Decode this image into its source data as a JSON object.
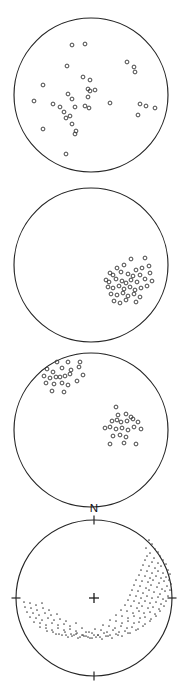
{
  "figure": {
    "background_color": "#ffffff",
    "outline_color": "#252525",
    "symbol_open_color": "#3a3a3a",
    "symbol_dot_color": "#4a4a4a",
    "width_px": 181,
    "height_px": 693,
    "north_label": "N"
  },
  "chart_data": [
    {
      "type": "scatter",
      "panel_index": 1,
      "projection": "equal-area lower hemisphere stereonet",
      "title": "",
      "xlabel": "",
      "ylabel": "",
      "symbol": "open-circle",
      "grid": false,
      "legend": null,
      "center_px": [
        91,
        95
      ],
      "radius_px": 77,
      "n_points": 40,
      "points_px": [
        [
          72,
          45
        ],
        [
          85,
          44
        ],
        [
          67,
          66
        ],
        [
          127,
          62
        ],
        [
          134,
          67
        ],
        [
          135,
          72
        ],
        [
          83,
          77
        ],
        [
          90,
          80
        ],
        [
          43,
          85
        ],
        [
          34,
          101
        ],
        [
          53,
          104
        ],
        [
          88,
          89
        ],
        [
          90,
          91
        ],
        [
          95,
          90
        ],
        [
          68,
          94
        ],
        [
          72,
          99
        ],
        [
          88,
          97
        ],
        [
          75,
          107
        ],
        [
          85,
          106
        ],
        [
          89,
          108
        ],
        [
          110,
          103
        ],
        [
          60,
          107
        ],
        [
          64,
          112
        ],
        [
          66,
          118
        ],
        [
          140,
          104
        ],
        [
          146,
          106
        ],
        [
          155,
          108
        ],
        [
          70,
          116
        ],
        [
          138,
          115
        ],
        [
          72,
          124
        ],
        [
          76,
          131
        ],
        [
          43,
          129
        ],
        [
          75,
          134
        ],
        [
          66,
          154
        ]
      ]
    },
    {
      "type": "scatter",
      "panel_index": 2,
      "projection": "equal-area lower hemisphere stereonet",
      "title": "",
      "xlabel": "",
      "ylabel": "",
      "symbol": "open-circle",
      "grid": false,
      "legend": null,
      "center_px": [
        91,
        265
      ],
      "radius_px": 77,
      "n_points": 41,
      "cluster_center_px": [
        128,
        281
      ],
      "points_px": [
        [
          131,
          259
        ],
        [
          145,
          258
        ],
        [
          117,
          268
        ],
        [
          124,
          265
        ],
        [
          136,
          270
        ],
        [
          142,
          268
        ],
        [
          149,
          266
        ],
        [
          110,
          273
        ],
        [
          113,
          275
        ],
        [
          121,
          272
        ],
        [
          128,
          274
        ],
        [
          133,
          276
        ],
        [
          140,
          275
        ],
        [
          150,
          273
        ],
        [
          106,
          280
        ],
        [
          109,
          282
        ],
        [
          116,
          279
        ],
        [
          122,
          281
        ],
        [
          126,
          283
        ],
        [
          131,
          280
        ],
        [
          137,
          282
        ],
        [
          145,
          279
        ],
        [
          152,
          281
        ],
        [
          108,
          287
        ],
        [
          113,
          288
        ],
        [
          119,
          286
        ],
        [
          124,
          289
        ],
        [
          130,
          287
        ],
        [
          135,
          290
        ],
        [
          141,
          288
        ],
        [
          147,
          286
        ],
        [
          111,
          294
        ],
        [
          117,
          295
        ],
        [
          123,
          293
        ],
        [
          128,
          296
        ],
        [
          134,
          294
        ],
        [
          140,
          297
        ],
        [
          114,
          301
        ],
        [
          120,
          303
        ],
        [
          126,
          300
        ],
        [
          136,
          302
        ]
      ]
    },
    {
      "type": "scatter",
      "panel_index": 3,
      "projection": "equal-area lower hemisphere stereonet",
      "title": "",
      "xlabel": "",
      "ylabel": "",
      "symbol": "open-circle",
      "grid": false,
      "legend": null,
      "center_px": [
        91,
        430
      ],
      "radius_px": 77,
      "n_points": 40,
      "cluster_a_center_px": [
        62,
        378
      ],
      "cluster_b_center_px": [
        121,
        424
      ],
      "points_px": [
        [
          57,
          362
        ],
        [
          68,
          362
        ],
        [
          80,
          362
        ],
        [
          47,
          369
        ],
        [
          53,
          372
        ],
        [
          62,
          368
        ],
        [
          71,
          370
        ],
        [
          79,
          367
        ],
        [
          44,
          376
        ],
        [
          50,
          378
        ],
        [
          56,
          377
        ],
        [
          60,
          377
        ],
        [
          65,
          376
        ],
        [
          70,
          374
        ],
        [
          83,
          375
        ],
        [
          46,
          383
        ],
        [
          54,
          384
        ],
        [
          62,
          383
        ],
        [
          68,
          385
        ],
        [
          77,
          381
        ],
        [
          52,
          391
        ],
        [
          64,
          392
        ],
        [
          116,
          407
        ],
        [
          118,
          415
        ],
        [
          126,
          414
        ],
        [
          131,
          417
        ],
        [
          112,
          421
        ],
        [
          117,
          420
        ],
        [
          121,
          422
        ],
        [
          127,
          421
        ],
        [
          133,
          419
        ],
        [
          138,
          422
        ],
        [
          105,
          428
        ],
        [
          110,
          427
        ],
        [
          116,
          429
        ],
        [
          122,
          428
        ],
        [
          128,
          430
        ],
        [
          134,
          427
        ],
        [
          141,
          429
        ],
        [
          113,
          436
        ],
        [
          120,
          435
        ],
        [
          126,
          437
        ],
        [
          110,
          444
        ],
        [
          124,
          443
        ],
        [
          136,
          444
        ]
      ]
    },
    {
      "type": "scatter",
      "panel_index": 4,
      "projection": "equal-area lower hemisphere stereonet",
      "title": "",
      "xlabel": "",
      "ylabel": "",
      "symbol": "small-filled-dot",
      "grid": false,
      "legend": null,
      "center_px": [
        94,
        598
      ],
      "radius_px": 78,
      "north_label": "N",
      "tick_azimuths_deg": [
        0,
        90,
        180,
        270
      ],
      "center_marker": "plus-cross",
      "n_points": 210,
      "pattern": "girdle arc sweeping from NE rim through SE and S to SW",
      "points_px": [
        [
          149,
          540
        ],
        [
          152,
          544
        ],
        [
          146,
          548
        ],
        [
          155,
          549
        ],
        [
          150,
          553
        ],
        [
          158,
          552
        ],
        [
          147,
          556
        ],
        [
          154,
          558
        ],
        [
          160,
          556
        ],
        [
          145,
          560
        ],
        [
          152,
          562
        ],
        [
          158,
          563
        ],
        [
          163,
          560
        ],
        [
          143,
          565
        ],
        [
          149,
          566
        ],
        [
          155,
          568
        ],
        [
          161,
          566
        ],
        [
          166,
          564
        ],
        [
          141,
          570
        ],
        [
          147,
          571
        ],
        [
          152,
          573
        ],
        [
          158,
          571
        ],
        [
          163,
          573
        ],
        [
          168,
          570
        ],
        [
          139,
          575
        ],
        [
          145,
          576
        ],
        [
          150,
          578
        ],
        [
          156,
          576
        ],
        [
          161,
          578
        ],
        [
          166,
          577
        ],
        [
          170,
          574
        ],
        [
          136,
          580
        ],
        [
          142,
          581
        ],
        [
          148,
          582
        ],
        [
          153,
          580
        ],
        [
          159,
          583
        ],
        [
          164,
          581
        ],
        [
          169,
          580
        ],
        [
          134,
          585
        ],
        [
          140,
          586
        ],
        [
          146,
          588
        ],
        [
          151,
          585
        ],
        [
          157,
          587
        ],
        [
          162,
          589
        ],
        [
          167,
          586
        ],
        [
          171,
          584
        ],
        [
          132,
          590
        ],
        [
          138,
          591
        ],
        [
          143,
          593
        ],
        [
          149,
          590
        ],
        [
          154,
          592
        ],
        [
          160,
          594
        ],
        [
          165,
          591
        ],
        [
          170,
          590
        ],
        [
          130,
          595
        ],
        [
          136,
          596
        ],
        [
          141,
          598
        ],
        [
          147,
          596
        ],
        [
          152,
          598
        ],
        [
          158,
          597
        ],
        [
          163,
          599
        ],
        [
          168,
          596
        ],
        [
          128,
          600
        ],
        [
          134,
          601
        ],
        [
          139,
          603
        ],
        [
          145,
          601
        ],
        [
          150,
          603
        ],
        [
          156,
          602
        ],
        [
          161,
          604
        ],
        [
          166,
          601
        ],
        [
          125,
          605
        ],
        [
          131,
          606
        ],
        [
          137,
          608
        ],
        [
          142,
          606
        ],
        [
          148,
          608
        ],
        [
          153,
          607
        ],
        [
          159,
          609
        ],
        [
          164,
          606
        ],
        [
          121,
          610
        ],
        [
          127,
          611
        ],
        [
          133,
          613
        ],
        [
          139,
          611
        ],
        [
          144,
          613
        ],
        [
          150,
          612
        ],
        [
          155,
          614
        ],
        [
          160,
          611
        ],
        [
          116,
          615
        ],
        [
          122,
          616
        ],
        [
          128,
          618
        ],
        [
          134,
          616
        ],
        [
          140,
          618
        ],
        [
          145,
          617
        ],
        [
          151,
          619
        ],
        [
          156,
          616
        ],
        [
          110,
          620
        ],
        [
          116,
          621
        ],
        [
          122,
          623
        ],
        [
          128,
          621
        ],
        [
          134,
          623
        ],
        [
          139,
          622
        ],
        [
          145,
          624
        ],
        [
          150,
          621
        ],
        [
          103,
          625
        ],
        [
          109,
          626
        ],
        [
          115,
          628
        ],
        [
          121,
          626
        ],
        [
          127,
          628
        ],
        [
          132,
          627
        ],
        [
          138,
          629
        ],
        [
          143,
          626
        ],
        [
          95,
          629
        ],
        [
          101,
          630
        ],
        [
          107,
          632
        ],
        [
          113,
          630
        ],
        [
          119,
          632
        ],
        [
          125,
          631
        ],
        [
          130,
          633
        ],
        [
          136,
          630
        ],
        [
          86,
          632
        ],
        [
          92,
          633
        ],
        [
          98,
          635
        ],
        [
          104,
          633
        ],
        [
          110,
          635
        ],
        [
          116,
          634
        ],
        [
          122,
          636
        ],
        [
          128,
          633
        ],
        [
          76,
          634
        ],
        [
          82,
          635
        ],
        [
          88,
          637
        ],
        [
          94,
          635
        ],
        [
          100,
          637
        ],
        [
          106,
          636
        ],
        [
          112,
          638
        ],
        [
          118,
          635
        ],
        [
          66,
          635
        ],
        [
          72,
          636
        ],
        [
          78,
          638
        ],
        [
          84,
          636
        ],
        [
          90,
          638
        ],
        [
          96,
          637
        ],
        [
          102,
          639
        ],
        [
          108,
          636
        ],
        [
          56,
          634
        ],
        [
          62,
          635
        ],
        [
          68,
          637
        ],
        [
          74,
          635
        ],
        [
          80,
          637
        ],
        [
          86,
          636
        ],
        [
          92,
          638
        ],
        [
          98,
          635
        ],
        [
          47,
          631
        ],
        [
          53,
          632
        ],
        [
          59,
          634
        ],
        [
          65,
          632
        ],
        [
          71,
          634
        ],
        [
          77,
          633
        ],
        [
          83,
          635
        ],
        [
          89,
          632
        ],
        [
          40,
          627
        ],
        [
          46,
          628
        ],
        [
          52,
          630
        ],
        [
          58,
          628
        ],
        [
          64,
          630
        ],
        [
          70,
          629
        ],
        [
          76,
          631
        ],
        [
          82,
          628
        ],
        [
          34,
          622
        ],
        [
          40,
          623
        ],
        [
          46,
          625
        ],
        [
          52,
          623
        ],
        [
          58,
          625
        ],
        [
          64,
          624
        ],
        [
          70,
          626
        ],
        [
          76,
          623
        ],
        [
          30,
          617
        ],
        [
          36,
          618
        ],
        [
          42,
          620
        ],
        [
          48,
          618
        ],
        [
          54,
          620
        ],
        [
          60,
          619
        ],
        [
          66,
          621
        ],
        [
          27,
          612
        ],
        [
          33,
          613
        ],
        [
          39,
          615
        ],
        [
          45,
          613
        ],
        [
          51,
          615
        ],
        [
          57,
          614
        ],
        [
          25,
          607
        ],
        [
          31,
          608
        ],
        [
          37,
          610
        ],
        [
          43,
          608
        ],
        [
          49,
          610
        ],
        [
          24,
          602
        ],
        [
          30,
          603
        ],
        [
          36,
          605
        ],
        [
          42,
          603
        ]
      ]
    }
  ],
  "panels": [
    {
      "id": "panel-1",
      "label": "",
      "symbol_type": "open-circle"
    },
    {
      "id": "panel-2",
      "label": "",
      "symbol_type": "open-circle"
    },
    {
      "id": "panel-3",
      "label": "",
      "symbol_type": "open-circle"
    },
    {
      "id": "panel-4",
      "label": "N",
      "symbol_type": "small-filled-dot"
    }
  ]
}
